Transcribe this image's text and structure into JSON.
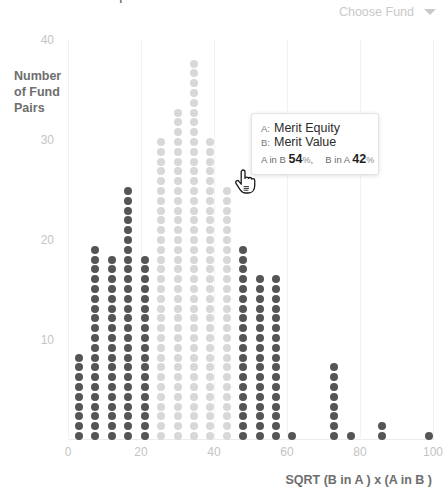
{
  "header": {
    "title_clipped": "Fund Overlap",
    "fund_select": {
      "label": "Choose Fund",
      "caret_icon": "chevron-down-icon"
    }
  },
  "tooltip": {
    "key_a": "A:",
    "fund_a": "Merit Equity",
    "key_b": "B:",
    "fund_b": "Merit Value",
    "a_in_b_label": "A in B",
    "a_in_b_value": "54",
    "b_in_a_label": "B in A",
    "b_in_a_value": "42",
    "percent_sign": "%",
    "comma": ","
  },
  "cursor": {
    "icon": "pointing-hand-cursor"
  },
  "chart_data": {
    "type": "bar",
    "title": "Fund Overlap",
    "xlabel": "SQRT (B in A ) x (A in B )",
    "ylabel": "Number\nof Fund\nPairs",
    "ylabel_lines": [
      "Number",
      "of Fund",
      "Pairs"
    ],
    "xlim": [
      0,
      100
    ],
    "ylim": [
      0,
      40
    ],
    "xticks": [
      0,
      20,
      40,
      60,
      80,
      100
    ],
    "yticks": [
      10,
      20,
      30,
      40
    ],
    "grid": "vertical-only",
    "legend": "none",
    "note": "Dot-density histogram: each dot = 1 fund pair. Highlighted (dark) bins are the selected fund's pairs; faded (light) bins are the rest of the distribution.",
    "colors": {
      "dot_dark": "#555555",
      "dot_light": "#d8d8d8",
      "axis_text": "#c4c4c4",
      "label_text": "#6e6e6e",
      "gridline": "#f2f2f2"
    },
    "categories": [
      3,
      7.5,
      12,
      16.5,
      21,
      25.5,
      30,
      34.5,
      39,
      43.5,
      48,
      52.5,
      57,
      61.5,
      73,
      77.5,
      86,
      99
    ],
    "values": [
      9,
      20,
      19,
      26,
      19,
      31,
      34,
      39,
      31,
      26,
      20,
      17,
      17,
      1,
      8,
      1,
      2,
      1
    ],
    "highlight": [
      true,
      true,
      true,
      true,
      true,
      false,
      false,
      false,
      false,
      false,
      true,
      true,
      true,
      true,
      true,
      true,
      true,
      true
    ],
    "series": [
      {
        "name": "Fund pairs",
        "points": [
          {
            "x": 3,
            "count": 9,
            "shade": "dark"
          },
          {
            "x": 7.5,
            "count": 20,
            "shade": "dark"
          },
          {
            "x": 12,
            "count": 19,
            "shade": "dark"
          },
          {
            "x": 16.5,
            "count": 26,
            "shade": "dark"
          },
          {
            "x": 21,
            "count": 19,
            "shade": "dark"
          },
          {
            "x": 25.5,
            "count": 31,
            "shade": "light"
          },
          {
            "x": 30,
            "count": 34,
            "shade": "light"
          },
          {
            "x": 34.5,
            "count": 39,
            "shade": "light"
          },
          {
            "x": 39,
            "count": 31,
            "shade": "light"
          },
          {
            "x": 43.5,
            "count": 26,
            "shade": "light"
          },
          {
            "x": 48,
            "count": 20,
            "shade": "dark"
          },
          {
            "x": 52.5,
            "count": 17,
            "shade": "dark"
          },
          {
            "x": 57,
            "count": 17,
            "shade": "dark"
          },
          {
            "x": 61.5,
            "count": 1,
            "shade": "dark"
          },
          {
            "x": 73,
            "count": 8,
            "shade": "dark"
          },
          {
            "x": 77.5,
            "count": 1,
            "shade": "dark"
          },
          {
            "x": 86,
            "count": 2,
            "shade": "dark"
          },
          {
            "x": 99,
            "count": 1,
            "shade": "dark"
          }
        ]
      }
    ]
  }
}
